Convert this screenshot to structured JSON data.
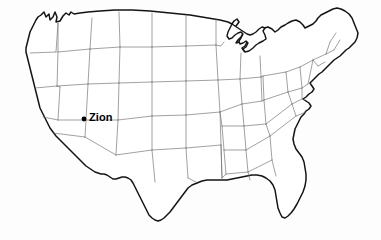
{
  "figure": {
    "kind": "map",
    "region": "Contiguous United States",
    "background_color": "#fdfdfd",
    "width": 381,
    "height": 240
  },
  "styles": {
    "nation_outline_color": "#141414",
    "state_border_color": "#6e6e6e",
    "land_fill": "#ffffff",
    "marker_color": "#000000",
    "label_color": "#000000"
  },
  "markers": [
    {
      "label": "Zion",
      "dot_x": 84,
      "dot_y": 119,
      "label_x": 89,
      "label_y": 113,
      "state": "Utah"
    }
  ],
  "legend": {
    "present": false
  }
}
